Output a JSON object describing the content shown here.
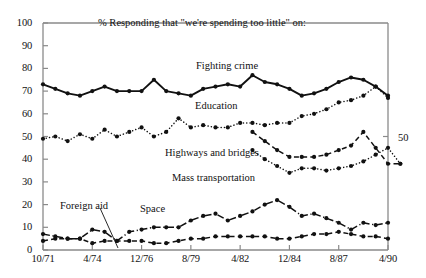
{
  "chart_data": {
    "type": "line",
    "title": "% Responding that \"we're spending too little\" on:",
    "xlabel": "",
    "ylabel": "",
    "ylim": [
      0,
      100
    ],
    "ytick_step": 10,
    "yticks": [
      "0",
      "10",
      "20",
      "30",
      "40",
      "50",
      "60",
      "70",
      "80",
      "90",
      "100"
    ],
    "right_axis_label": "50",
    "grid": false,
    "legend": "inline-labels",
    "x_tick_labels": [
      "10/71",
      "4/74",
      "12/76",
      "8/79",
      "4/82",
      "12/84",
      "8/87",
      "4/90"
    ],
    "x_tick_indices": [
      0,
      4,
      8,
      12,
      16,
      20,
      24,
      28
    ],
    "x_index_count": 29,
    "series": [
      {
        "name": "Fighting crime",
        "style": "solid",
        "color": "#111111",
        "label_x": 196,
        "label_y": 60,
        "values": [
          73,
          71,
          69,
          68,
          70,
          72,
          70,
          70,
          70,
          75,
          70,
          69,
          68,
          71,
          72,
          73,
          72,
          77,
          74,
          73,
          71,
          68,
          69,
          71,
          74,
          76,
          75,
          72,
          68
        ]
      },
      {
        "name": "Education",
        "style": "dotted",
        "color": "#111111",
        "label_x": 195,
        "label_y": 100,
        "values": [
          49,
          50,
          48,
          51,
          49,
          53,
          50,
          52,
          54,
          50,
          52,
          58,
          54,
          55,
          54,
          54,
          56,
          56,
          55,
          56,
          56,
          59,
          60,
          62,
          65,
          66,
          68,
          72,
          67
        ]
      },
      {
        "name": "Highways and bridges",
        "style": "dashed",
        "color": "#111111",
        "label_x": 165,
        "label_y": 147,
        "start_index": 17,
        "values": [
          52,
          48,
          44,
          41,
          41,
          41,
          42,
          44,
          46,
          52,
          45,
          38,
          38
        ]
      },
      {
        "name": "Mass transportation",
        "style": "dotted",
        "color": "#111111",
        "label_x": 172,
        "label_y": 172,
        "start_index": 17,
        "values": [
          44,
          40,
          37,
          34,
          36,
          36,
          35,
          36,
          37,
          39,
          42,
          45,
          38
        ]
      },
      {
        "name": "Space",
        "style": "dashdot",
        "color": "#111111",
        "label_x": 140,
        "label_y": 203,
        "values": [
          7,
          6,
          5,
          5,
          9,
          8,
          4,
          8,
          9,
          10,
          10,
          10,
          13,
          15,
          16,
          13,
          15,
          17,
          20,
          22,
          19,
          15,
          16,
          14,
          12,
          9,
          12,
          11,
          12
        ]
      },
      {
        "name": "Foreign aid",
        "style": "dashed",
        "color": "#111111",
        "label_x": 60,
        "label_y": 200,
        "leader": {
          "x1": 100,
          "y1": 208,
          "x2": 118,
          "y2": 248
        },
        "values": [
          4,
          5,
          5,
          5,
          3,
          4,
          4,
          4,
          4,
          3,
          3,
          4,
          5,
          5,
          6,
          6,
          6,
          6,
          6,
          5,
          5,
          6,
          7,
          7,
          8,
          7,
          6,
          6,
          5
        ]
      }
    ]
  }
}
